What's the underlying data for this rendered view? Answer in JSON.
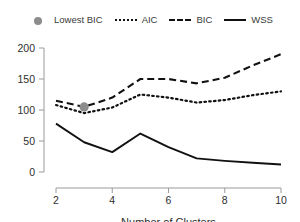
{
  "legend": {
    "entries": [
      {
        "label": "Lowest BIC",
        "key": "filled-circle-marker"
      },
      {
        "label": "AIC",
        "key": "dotted-line"
      },
      {
        "label": "BIC",
        "key": "dashed-line"
      },
      {
        "label": "WSS",
        "key": "solid-line"
      }
    ]
  },
  "axes": {
    "x_title": "Number of Clusters",
    "y_title": "",
    "x_ticks": [
      "2",
      "4",
      "6",
      "8",
      "10"
    ],
    "y_ticks": [
      "0",
      "50",
      "100",
      "150",
      "200"
    ]
  },
  "colors": {
    "line": "#111111",
    "marker": "#8c8c8c",
    "axis": "#9a9a9a",
    "text": "#2e2e2e",
    "background": "#ffffff"
  },
  "chart_data": {
    "type": "line",
    "title": "",
    "xlabel": "Number of Clusters",
    "ylabel": "",
    "xlim": [
      2,
      10
    ],
    "ylim": [
      0,
      200
    ],
    "grid": false,
    "legend_position": "top",
    "x": [
      2,
      3,
      4,
      5,
      6,
      7,
      8,
      9,
      10
    ],
    "series": [
      {
        "name": "AIC",
        "style": "dotted",
        "values": [
          108,
          95,
          104,
          125,
          120,
          112,
          116,
          124,
          130
        ]
      },
      {
        "name": "BIC",
        "style": "dashed",
        "values": [
          115,
          105,
          120,
          150,
          150,
          143,
          152,
          172,
          190
        ]
      },
      {
        "name": "WSS",
        "style": "solid",
        "values": [
          78,
          48,
          32,
          62,
          40,
          22,
          18,
          15,
          12
        ]
      }
    ],
    "annotations": [
      {
        "name": "Lowest BIC",
        "x": 3,
        "y": 105,
        "marker": "filled-circle"
      }
    ]
  }
}
